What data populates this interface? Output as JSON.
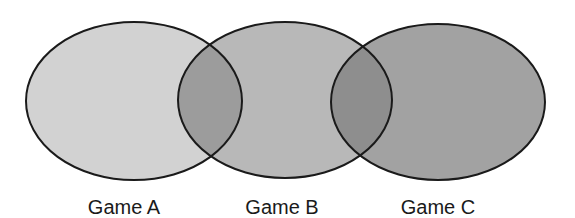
{
  "diagram": {
    "type": "venn",
    "sets": [
      {
        "id": "A",
        "label": "Game A",
        "fill": "#d2d2d2",
        "cx": 134,
        "cy": 101,
        "rx": 108,
        "ry": 79
      },
      {
        "id": "B",
        "label": "Game B",
        "fill": "#b8b8b8",
        "cx": 285,
        "cy": 100,
        "rx": 107,
        "ry": 78
      },
      {
        "id": "C",
        "label": "Game C",
        "fill": "#a2a2a2",
        "cx": 438,
        "cy": 102,
        "rx": 107,
        "ry": 78
      }
    ],
    "overlap_fill": "#8e8e8e",
    "stroke": "#1a1a1a"
  }
}
